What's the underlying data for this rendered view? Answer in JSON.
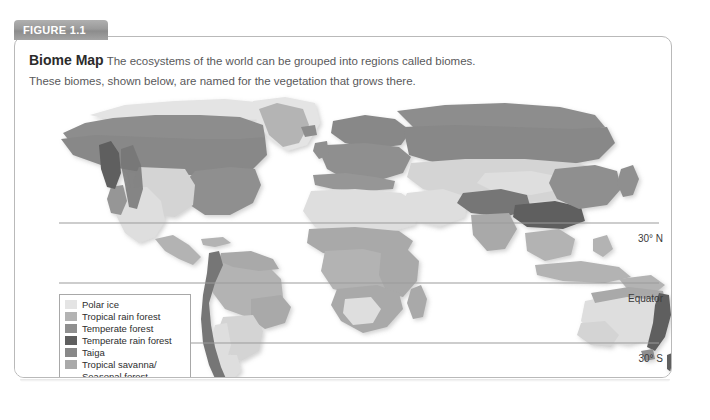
{
  "figure": {
    "tab_label": "FIGURE 1.1",
    "title": "Biome Map",
    "description_line1": "The ecosystems of the world can be grouped into regions called biomes.",
    "description_line2": "These biomes, shown below, are named for the vegetation that grows there."
  },
  "map": {
    "latitude_labels": {
      "north_30": "30° N",
      "equator": "Equator",
      "south_30": "30° S"
    },
    "projection_note": "world-map-grayscale"
  },
  "legend": {
    "items": [
      {
        "label": "Polar ice",
        "color": "#e4e4e4"
      },
      {
        "label": "Tropical rain forest",
        "color": "#b3b3b3"
      },
      {
        "label": "Temperate forest",
        "color": "#8f8f8f"
      },
      {
        "label": "Temperate rain forest",
        "color": "#5f5f5f"
      },
      {
        "label": "Taiga",
        "color": "#888888"
      },
      {
        "label": "Tropical savanna/",
        "color": "#a9a9a9",
        "continuation": "Seasonal forest"
      },
      {
        "label": "Temperate grassland",
        "color": "#d4d4d4"
      },
      {
        "label": "Chaparral",
        "color": "#969696"
      },
      {
        "label": "Desert",
        "color": "#dedede"
      },
      {
        "label": "Tundra",
        "color": "#8d8d8d"
      },
      {
        "label": "Mountains",
        "color": "#767676"
      }
    ]
  },
  "colors": {
    "frame_border": "#b9b9b9",
    "tab_background": "#9a9a9a",
    "tab_text": "#ffffff",
    "caption_text": "#59595b",
    "title_text": "#2b2b2b",
    "ocean": "#ffffff",
    "latitude_line": "#9b9b9b"
  },
  "chart_data": {
    "type": "map",
    "title": "Biome Map",
    "projection": "equirectangular world map (grayscale)",
    "legend_categories": [
      "Polar ice",
      "Tropical rain forest",
      "Temperate forest",
      "Temperate rain forest",
      "Taiga",
      "Tropical savanna/Seasonal forest",
      "Temperate grassland",
      "Chaparral",
      "Desert",
      "Tundra",
      "Mountains"
    ],
    "gridlines": [
      "30° N",
      "Equator",
      "30° S"
    ],
    "legend_position": "lower-left"
  }
}
